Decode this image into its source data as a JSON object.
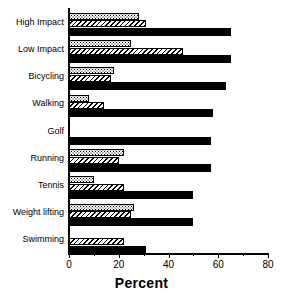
{
  "chart_data": {
    "type": "bar",
    "orientation": "horizontal",
    "title": "",
    "xlabel": "Percent",
    "ylabel": "",
    "xlim": [
      0,
      80
    ],
    "xticks": [
      0,
      20,
      40,
      60,
      80
    ],
    "xtick_labels": [
      "0",
      "20",
      "40",
      "60",
      "80"
    ],
    "grid": false,
    "legend": "none",
    "categories": [
      "High Impact",
      "Low Impact",
      "Bicycling",
      "Walking",
      "Golf",
      "Running",
      "Tennis",
      "Weight lifting",
      "Swimming"
    ],
    "series": [
      {
        "name": "series-1",
        "pattern": "dotted",
        "values": [
          28,
          25,
          18,
          8,
          0,
          22,
          10,
          26,
          0
        ]
      },
      {
        "name": "series-2",
        "pattern": "hatched",
        "values": [
          31,
          46,
          17,
          14,
          0,
          20,
          22,
          25,
          22
        ]
      },
      {
        "name": "series-3",
        "pattern": "solid",
        "values": [
          65,
          65,
          63,
          58,
          57,
          57,
          50,
          50,
          31
        ]
      }
    ]
  },
  "axis": {
    "x_title": "Percent"
  }
}
